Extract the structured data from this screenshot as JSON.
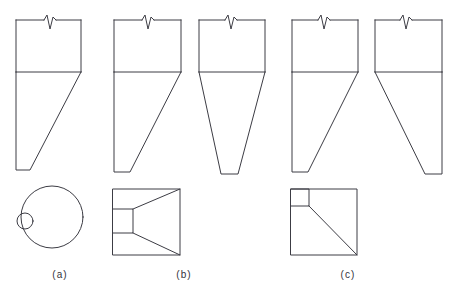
{
  "figure": {
    "background_color": "#ffffff",
    "line_color": "#3c3c44",
    "line_width": 1,
    "width": 450,
    "height": 292,
    "groups": [
      {
        "id": "a",
        "caption": "(a)",
        "caption_x": 60,
        "caption_y": 278,
        "description": "Circular silo with eccentric single outlet",
        "elevations": [
          {
            "id": "a-1",
            "name": "eccentric-hopper-left-outlet",
            "shell": {
              "x": 16,
              "y": 20,
              "width": 65,
              "height": 52
            },
            "transition_y": 72,
            "break_mark": {
              "x": 44,
              "y": 20,
              "width": 12,
              "height": 11
            },
            "hopper": {
              "type": "asymmetric-left",
              "top_left_x": 16,
              "top_right_x": 81,
              "bottom_left_x": 16,
              "bottom_right_x": 30,
              "bottom_y": 170
            }
          }
        ],
        "plan": {
          "id": "a-plan",
          "name": "circular-plan-eccentric-outlet",
          "type": "circle-with-small-circle",
          "outer": {
            "cx": 52,
            "cy": 217,
            "r": 31
          },
          "outlet": {
            "cx": 25,
            "cy": 221,
            "r": 8
          }
        }
      },
      {
        "id": "b",
        "caption": "(b)",
        "caption_x": 184,
        "caption_y": 278,
        "description": "Square silo with slot outlet, wedge and conical hoppers",
        "elevations": [
          {
            "id": "b-1",
            "name": "wedge-hopper-left-outlet",
            "shell": {
              "x": 114,
              "y": 20,
              "width": 67,
              "height": 52
            },
            "transition_y": 72,
            "break_mark": {
              "x": 142,
              "y": 20,
              "width": 12,
              "height": 11
            },
            "hopper": {
              "type": "asymmetric-left",
              "top_left_x": 114,
              "top_right_x": 181,
              "bottom_left_x": 114,
              "bottom_right_x": 130,
              "bottom_y": 172
            }
          },
          {
            "id": "b-2",
            "name": "conical-hopper-centered-outlet",
            "shell": {
              "x": 199,
              "y": 20,
              "width": 66,
              "height": 52
            },
            "transition_y": 72,
            "break_mark": {
              "x": 225,
              "y": 20,
              "width": 12,
              "height": 11
            },
            "hopper": {
              "type": "symmetric-cone",
              "top_left_x": 199,
              "top_right_x": 265,
              "bottom_left_x": 221,
              "bottom_right_x": 238,
              "bottom_y": 174
            }
          }
        ],
        "plan": {
          "id": "b-plan",
          "name": "square-plan-slot-outlet",
          "type": "square-with-left-slot",
          "square": {
            "x": 113,
            "y": 189,
            "width": 67,
            "height": 66
          },
          "slot": {
            "x": 113,
            "y": 209,
            "width": 20,
            "height": 24
          },
          "valley_lines": [
            {
              "x1": 133,
              "y1": 209,
              "x2": 180,
              "y2": 189
            },
            {
              "x1": 133,
              "y1": 233,
              "x2": 180,
              "y2": 255
            }
          ]
        }
      },
      {
        "id": "c",
        "caption": "(c)",
        "caption_x": 348,
        "caption_y": 278,
        "description": "Square silo with corner outlet, two orthogonal elevations",
        "elevations": [
          {
            "id": "c-1",
            "name": "corner-hopper-left-outlet",
            "shell": {
              "x": 292,
              "y": 20,
              "width": 66,
              "height": 52
            },
            "transition_y": 72,
            "break_mark": {
              "x": 318,
              "y": 20,
              "width": 12,
              "height": 11
            },
            "hopper": {
              "type": "asymmetric-left",
              "top_left_x": 292,
              "top_right_x": 358,
              "bottom_left_x": 292,
              "bottom_right_x": 308,
              "bottom_y": 172
            }
          },
          {
            "id": "c-2",
            "name": "corner-hopper-right-outlet",
            "shell": {
              "x": 375,
              "y": 20,
              "width": 67,
              "height": 52
            },
            "transition_y": 72,
            "break_mark": {
              "x": 400,
              "y": 20,
              "width": 12,
              "height": 11
            },
            "hopper": {
              "type": "asymmetric-right",
              "top_left_x": 375,
              "top_right_x": 442,
              "bottom_left_x": 425,
              "bottom_right_x": 442,
              "bottom_y": 174
            }
          }
        ],
        "plan": {
          "id": "c-plan",
          "name": "square-plan-corner-outlet",
          "type": "square-with-corner-box",
          "square": {
            "x": 291,
            "y": 189,
            "width": 66,
            "height": 66
          },
          "corner_box": {
            "x": 291,
            "y": 189,
            "width": 18,
            "height": 17
          },
          "diagonal": {
            "x1": 309,
            "y1": 206,
            "x2": 357,
            "y2": 255
          }
        }
      }
    ]
  }
}
